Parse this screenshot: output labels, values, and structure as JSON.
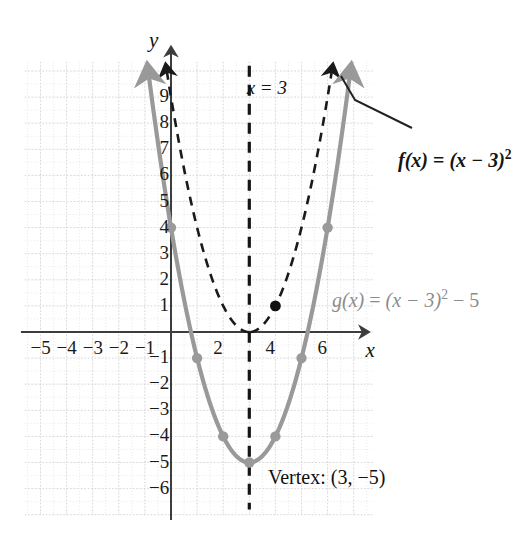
{
  "figure": {
    "axis_x_label": "x",
    "axis_y_label": "y",
    "vertex_label": "Vertex: (3, −5)",
    "vline_label": "x = 3",
    "f_label_plain": "f(x) = (x − 3)²",
    "g_label_plain": "g(x) = (x − 3)² − 5",
    "f_label_parts": {
      "name": "f",
      "args": "(x)",
      "eq": " = ",
      "base": "(x − 3)",
      "exp": "2"
    },
    "g_label_parts": {
      "name": "g",
      "args": "(x)",
      "eq": " = ",
      "base": "(x − 3)",
      "exp": "2",
      "tail": " − 5"
    },
    "colors": {
      "curve_g": "#999999",
      "curve_f": "#1a1a1a",
      "axis": "#3d3d3d",
      "grid_major": "#d8d8d8",
      "grid_minor": "#e8e8e8",
      "point_g": "#9a9a9a",
      "point_f": "#111111",
      "vline": "#151515",
      "leader": "#222222"
    }
  },
  "chart_data": {
    "type": "line",
    "title": "",
    "xlabel": "x",
    "ylabel": "y",
    "xlim": [
      -5.6,
      7.8
    ],
    "ylim": [
      -7.0,
      10.4
    ],
    "grid": true,
    "grid_step_major": 1,
    "grid_step_minor": 0.5,
    "legend": "inline-annotations",
    "xticks": [
      -5,
      -4,
      -3,
      -2,
      -1,
      2,
      4,
      6
    ],
    "xtick_labels": [
      "−5",
      "−4",
      "−3",
      "−2",
      "−1",
      "2",
      "4",
      "6"
    ],
    "yticks": [
      9,
      8,
      7,
      6,
      5,
      4,
      3,
      2,
      1,
      -1,
      -2,
      -3,
      -4,
      -5,
      -6
    ],
    "ytick_labels": [
      "9",
      "8",
      "7",
      "6",
      "5",
      "4",
      "3",
      "2",
      "1",
      "−1",
      "−2",
      "−3",
      "−4",
      "−5",
      "−6"
    ],
    "series": [
      {
        "name": "f(x) = (x − 3)²",
        "style": "dashed",
        "color": "#1a1a1a",
        "vertex": [
          3,
          0
        ],
        "x": [
          -0.2,
          0,
          0.5,
          1,
          1.5,
          2,
          2.5,
          3,
          3.5,
          4,
          4.5,
          5,
          5.5,
          6,
          6.2
        ],
        "values": [
          10.24,
          9,
          6.25,
          4,
          2.25,
          1,
          0.25,
          0,
          0.25,
          1,
          2.25,
          4,
          6.25,
          9,
          10.24
        ]
      },
      {
        "name": "g(x) = (x − 3)² − 5",
        "style": "solid",
        "color": "#999999",
        "vertex": [
          3,
          -5
        ],
        "x": [
          -0.9,
          -0.5,
          0,
          0.5,
          1,
          1.5,
          2,
          2.5,
          3,
          3.5,
          4,
          4.5,
          5,
          5.5,
          6,
          6.5,
          6.9
        ],
        "values": [
          10.21,
          7.25,
          4,
          1.25,
          -1,
          -2.75,
          -4,
          -4.75,
          -5,
          -4.75,
          -4,
          -2.75,
          -1,
          1.25,
          4,
          7.25,
          10.21
        ]
      }
    ],
    "marked_points": [
      {
        "series": "g",
        "x": 0,
        "y": 4,
        "color": "#9a9a9a"
      },
      {
        "series": "g",
        "x": 1,
        "y": -1,
        "color": "#9a9a9a"
      },
      {
        "series": "g",
        "x": 2,
        "y": -4,
        "color": "#9a9a9a"
      },
      {
        "series": "g",
        "x": 3,
        "y": -5,
        "color": "#9a9a9a"
      },
      {
        "series": "g",
        "x": 4,
        "y": -4,
        "color": "#9a9a9a"
      },
      {
        "series": "g",
        "x": 5,
        "y": -1,
        "color": "#9a9a9a"
      },
      {
        "series": "g",
        "x": 6,
        "y": 4,
        "color": "#9a9a9a"
      },
      {
        "series": "f",
        "x": 4,
        "y": 1,
        "color": "#111111"
      }
    ],
    "vertical_line": {
      "x": 3,
      "style": "dashed",
      "label": "x = 3"
    },
    "annotations": [
      {
        "text": "Vertex: (3, −5)",
        "x": 3.25,
        "y": -5.9
      },
      {
        "text": "f(x) = (x − 3)²",
        "x": 7.1,
        "y": 7.6
      },
      {
        "text": "g(x) = (x − 3)² − 5",
        "x": 6.5,
        "y": 1.2
      }
    ]
  }
}
